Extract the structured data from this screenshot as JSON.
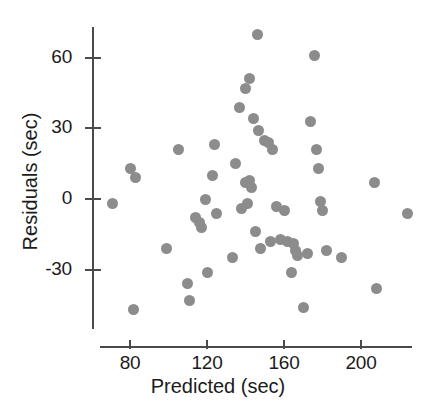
{
  "chart_data": {
    "type": "scatter",
    "title": "",
    "xlabel": "Predicted (sec)",
    "ylabel": "Residuals (sec)",
    "xlim": [
      68,
      232
    ],
    "ylim": [
      -52,
      78
    ],
    "grid": false,
    "legend": null,
    "marker_color": "#8c8c8c",
    "axis_color": "#4a4a4a",
    "xticks": [
      80,
      120,
      160,
      200
    ],
    "xticklabels": [
      "80",
      "120",
      "160",
      "200"
    ],
    "yticks": [
      60,
      30,
      0,
      -30
    ],
    "yticklabels": [
      "60",
      "30",
      "0",
      "-30"
    ],
    "series": [
      {
        "name": "residuals",
        "points": [
          [
            71,
            -2
          ],
          [
            80,
            13
          ],
          [
            83,
            9
          ],
          [
            82,
            -47
          ],
          [
            99,
            -21
          ],
          [
            105,
            21
          ],
          [
            110,
            -36
          ],
          [
            111,
            -43
          ],
          [
            114,
            -8
          ],
          [
            116,
            -10
          ],
          [
            117,
            -12
          ],
          [
            119,
            0
          ],
          [
            120,
            -31
          ],
          [
            123,
            10
          ],
          [
            124,
            23
          ],
          [
            125,
            -6
          ],
          [
            133,
            -25
          ],
          [
            135,
            15
          ],
          [
            137,
            39
          ],
          [
            138,
            -4
          ],
          [
            140,
            7
          ],
          [
            140,
            47
          ],
          [
            141,
            -2
          ],
          [
            142,
            8
          ],
          [
            142,
            51
          ],
          [
            143,
            5
          ],
          [
            144,
            34
          ],
          [
            145,
            -14
          ],
          [
            146,
            70
          ],
          [
            147,
            29
          ],
          [
            148,
            -21
          ],
          [
            150,
            25
          ],
          [
            152,
            24
          ],
          [
            153,
            -18
          ],
          [
            154,
            21
          ],
          [
            156,
            -3
          ],
          [
            158,
            -17
          ],
          [
            160,
            -5
          ],
          [
            162,
            -18
          ],
          [
            164,
            -31
          ],
          [
            165,
            -19
          ],
          [
            166,
            -22
          ],
          [
            167,
            -24
          ],
          [
            170,
            -46
          ],
          [
            172,
            -23
          ],
          [
            174,
            33
          ],
          [
            176,
            61
          ],
          [
            177,
            21
          ],
          [
            178,
            13
          ],
          [
            179,
            -1
          ],
          [
            180,
            -5
          ],
          [
            182,
            -22
          ],
          [
            190,
            -25
          ],
          [
            207,
            7
          ],
          [
            208,
            -38
          ],
          [
            224,
            -6
          ]
        ]
      }
    ]
  },
  "axes": {
    "y_title": "Residuals (sec)",
    "x_title": "Predicted (sec)"
  }
}
